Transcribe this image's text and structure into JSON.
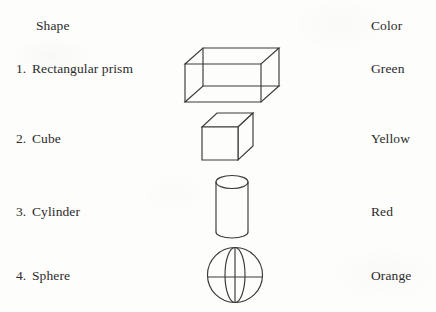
{
  "table": {
    "headers": {
      "shape": "Shape",
      "color": "Color"
    },
    "rows": [
      {
        "number": "1.",
        "shape": "Rectangular prism",
        "color": "Green",
        "figure": "rectangular-prism-wireframe"
      },
      {
        "number": "2.",
        "shape": "Cube",
        "color": "Yellow",
        "figure": "cube-solid"
      },
      {
        "number": "3.",
        "shape": "Cylinder",
        "color": "Red",
        "figure": "cylinder"
      },
      {
        "number": "4.",
        "shape": "Sphere",
        "color": "Orange",
        "figure": "sphere-wireframe"
      }
    ]
  },
  "style": {
    "ink": "#3a3a3a",
    "paper": "#fdfdfb"
  }
}
